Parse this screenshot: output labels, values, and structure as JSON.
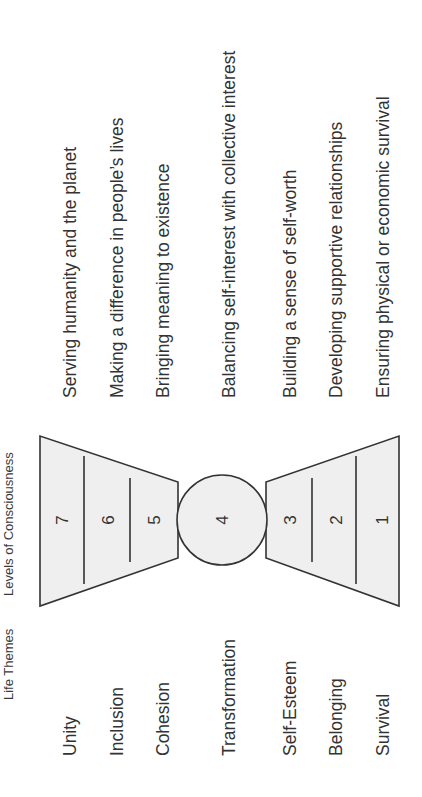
{
  "orientation": "rotated-90-ccw",
  "headers": {
    "life_themes": "Life Themes",
    "levels": "Levels of Consciousness"
  },
  "levels": [
    {
      "number": "7",
      "theme": "Unity",
      "description": "Serving humanity and the planet"
    },
    {
      "number": "6",
      "theme": "Inclusion",
      "description": "Making a difference in people’s lives"
    },
    {
      "number": "5",
      "theme": "Cohesion",
      "description": "Bringing meaning to existence"
    },
    {
      "number": "4",
      "theme": "Transformation",
      "description": "Balancing self-interest with collective interest"
    },
    {
      "number": "3",
      "theme": "Self-Esteem",
      "description": "Building a sense of self-worth"
    },
    {
      "number": "2",
      "theme": "Belonging",
      "description": "Developing supportive relationships"
    },
    {
      "number": "1",
      "theme": "Survival",
      "description": "Ensuring physical or economic survival"
    }
  ],
  "colors": {
    "fill": "#efefef",
    "stroke": "#333333",
    "text": "#333333"
  }
}
